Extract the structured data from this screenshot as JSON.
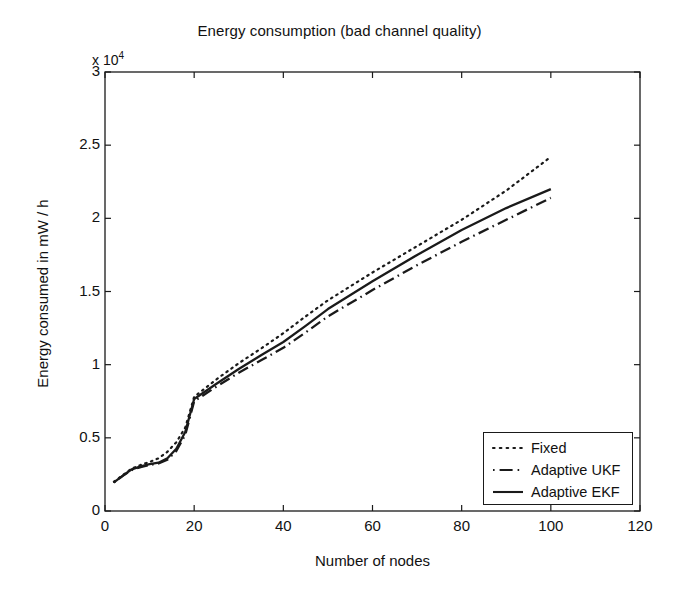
{
  "chart_data": {
    "type": "line",
    "title": "Energy consumption (bad channel quality)",
    "xlabel": "Number of nodes",
    "ylabel": "Energy consumed in mW / h",
    "y_multiplier_text": "x 10",
    "y_multiplier_exponent": "4",
    "xlim": [
      0,
      120
    ],
    "ylim": [
      0,
      30000
    ],
    "xticks": [
      0,
      20,
      40,
      60,
      80,
      100,
      120
    ],
    "xtick_labels": [
      "0",
      "20",
      "40",
      "60",
      "80",
      "100",
      "120"
    ],
    "yticks": [
      0,
      5000,
      10000,
      15000,
      20000,
      25000,
      30000
    ],
    "ytick_labels": [
      "0",
      "0.5",
      "1",
      "1.5",
      "2",
      "2.5",
      "3"
    ],
    "grid": false,
    "legend_position": "lower right",
    "x": [
      2,
      4,
      6,
      8,
      10,
      12,
      14,
      16,
      18,
      20,
      25,
      30,
      35,
      40,
      45,
      50,
      60,
      70,
      80,
      90,
      100
    ],
    "series": [
      {
        "name": "Fixed",
        "style": "dotted",
        "color": "#1a1a1a",
        "values": [
          2000,
          2450,
          2900,
          3150,
          3350,
          3600,
          4050,
          4700,
          5700,
          7800,
          9000,
          10100,
          11100,
          12150,
          13300,
          14400,
          16300,
          18100,
          19900,
          21900,
          24200
        ]
      },
      {
        "name": "Adaptive UKF",
        "style": "dashdot",
        "color": "#1a1a1a",
        "values": [
          1950,
          2400,
          2800,
          3000,
          3150,
          3250,
          3500,
          4100,
          5200,
          7500,
          8500,
          9450,
          10300,
          11150,
          12200,
          13300,
          15100,
          16800,
          18400,
          19900,
          21400
        ]
      },
      {
        "name": "Adaptive EKF",
        "style": "solid",
        "color": "#1a1a1a",
        "values": [
          1960,
          2420,
          2850,
          3050,
          3200,
          3300,
          3600,
          4250,
          5400,
          7650,
          8700,
          9700,
          10650,
          11550,
          12650,
          13800,
          15700,
          17500,
          19200,
          20700,
          22000
        ]
      }
    ]
  },
  "legend": {
    "items": [
      {
        "label": "Fixed",
        "style": "dotted"
      },
      {
        "label": "Adaptive UKF",
        "style": "dashdot"
      },
      {
        "label": "Adaptive EKF",
        "style": "solid"
      }
    ]
  }
}
